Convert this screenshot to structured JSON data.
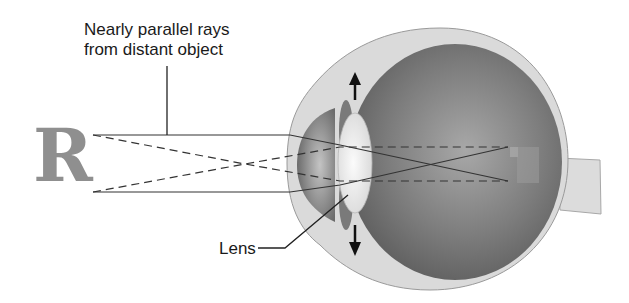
{
  "diagram": {
    "title": "Nearly parallel rays from distant object",
    "title_lines": [
      "Nearly parallel rays",
      "from distant object"
    ],
    "labels": {
      "lens": "Lens"
    },
    "object": {
      "letter": "R",
      "image_inverted": true
    },
    "parts": [
      "cornea",
      "iris",
      "lens",
      "vitreous body",
      "retina",
      "optic nerve",
      "sclera"
    ],
    "arrows": [
      "lens-stretch-up",
      "lens-stretch-down"
    ],
    "colors": {
      "object_letter": "#8f8f8f",
      "sclera": "#d9d9d9",
      "vitreous": "#7a7a7a",
      "lens": "#eeeeee",
      "rays": "#333333"
    }
  }
}
